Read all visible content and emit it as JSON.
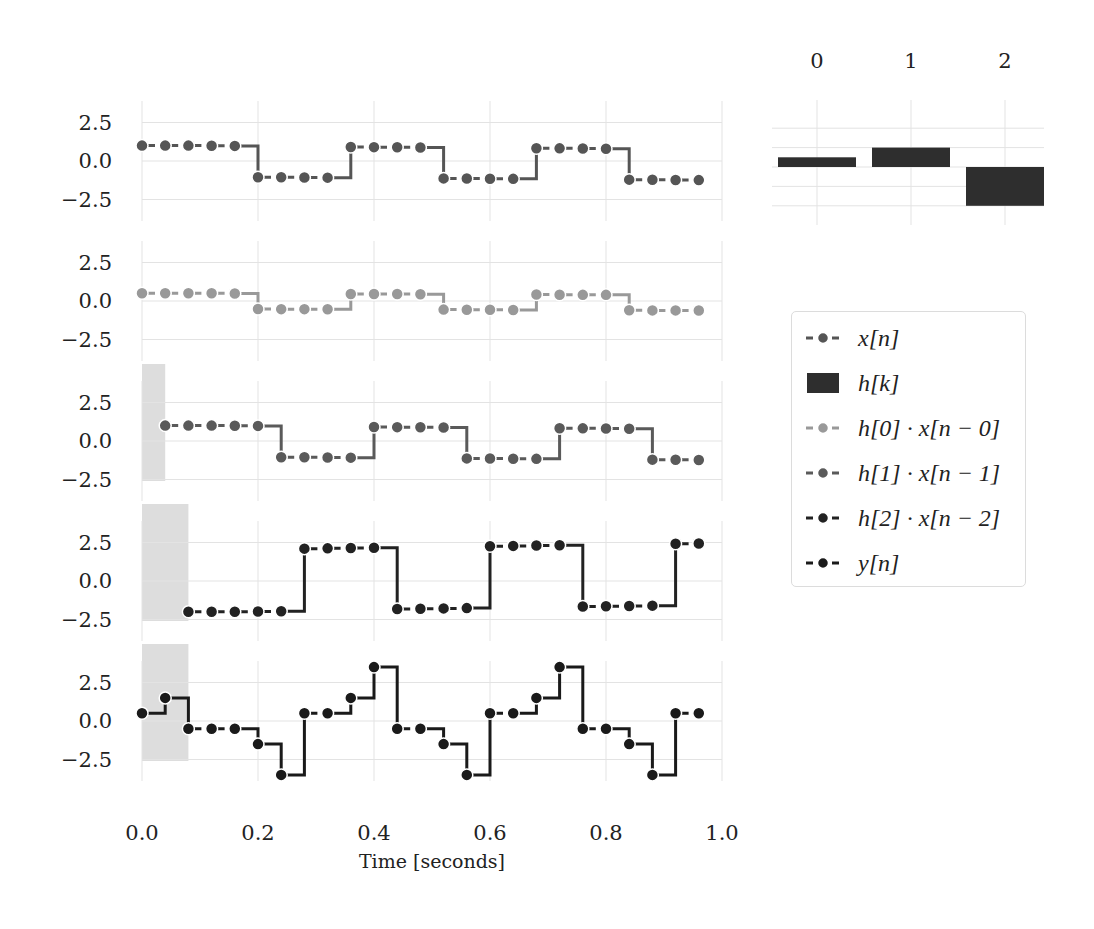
{
  "chart_data": [
    {
      "type": "line",
      "id": "x_n",
      "title": "",
      "legend_label": "x[n]",
      "color": "#555555",
      "xlabel": "Time [seconds]",
      "ylabel": "",
      "xlim": [
        0.0,
        1.0
      ],
      "ylim": [
        -4.0,
        4.0
      ],
      "yticks": [
        2.5,
        0.0,
        -2.5
      ],
      "ytick_labels": [
        "2.5",
        "0.0",
        "−2.5"
      ],
      "xticks": [
        0.0,
        0.2,
        0.4,
        0.6,
        0.8,
        1.0
      ],
      "xtick_labels": [
        "0.0",
        "0.2",
        "0.4",
        "0.6",
        "0.8",
        "1.0"
      ],
      "grid": true,
      "shaded_region": null,
      "x": [
        0.0,
        0.04,
        0.08,
        0.12,
        0.16,
        0.2,
        0.24,
        0.28,
        0.32,
        0.36,
        0.4,
        0.44,
        0.48,
        0.52,
        0.56,
        0.6,
        0.64,
        0.68,
        0.72,
        0.76,
        0.8,
        0.84,
        0.88,
        0.92,
        0.96
      ],
      "values": [
        1.0,
        1.0,
        1.0,
        0.99,
        0.98,
        -1.05,
        -1.06,
        -1.07,
        -1.08,
        0.91,
        0.9,
        0.89,
        0.88,
        -1.13,
        -1.14,
        -1.15,
        -1.16,
        0.83,
        0.82,
        0.81,
        0.8,
        -1.21,
        -1.22,
        -1.23,
        -1.24
      ]
    },
    {
      "type": "line",
      "id": "h0_x",
      "legend_label": "h[0] · x[n − 0]",
      "color": "#999999",
      "ylim": [
        -4.0,
        4.0
      ],
      "shaded_region": null,
      "x": [
        0.0,
        0.04,
        0.08,
        0.12,
        0.16,
        0.2,
        0.24,
        0.28,
        0.32,
        0.36,
        0.4,
        0.44,
        0.48,
        0.52,
        0.56,
        0.6,
        0.64,
        0.68,
        0.72,
        0.76,
        0.8,
        0.84,
        0.88,
        0.92,
        0.96
      ],
      "values": [
        0.5,
        0.5,
        0.5,
        0.5,
        0.49,
        -0.52,
        -0.53,
        -0.53,
        -0.54,
        0.46,
        0.45,
        0.45,
        0.44,
        -0.56,
        -0.57,
        -0.57,
        -0.58,
        0.42,
        0.41,
        0.4,
        0.4,
        -0.6,
        -0.61,
        -0.61,
        -0.62
      ]
    },
    {
      "type": "line",
      "id": "h1_x",
      "legend_label": "h[1] · x[n − 1]",
      "color": "#5a5a5a",
      "ylim": [
        -4.0,
        4.0
      ],
      "shaded_region": [
        0.0,
        0.04
      ],
      "x": [
        0.04,
        0.08,
        0.12,
        0.16,
        0.2,
        0.24,
        0.28,
        0.32,
        0.36,
        0.4,
        0.44,
        0.48,
        0.52,
        0.56,
        0.6,
        0.64,
        0.68,
        0.72,
        0.76,
        0.8,
        0.84,
        0.88,
        0.92,
        0.96
      ],
      "values": [
        1.0,
        1.0,
        1.0,
        0.99,
        0.98,
        -1.05,
        -1.06,
        -1.07,
        -1.08,
        0.91,
        0.9,
        0.89,
        0.88,
        -1.13,
        -1.14,
        -1.15,
        -1.16,
        0.83,
        0.82,
        0.81,
        0.8,
        -1.21,
        -1.22,
        -1.23
      ]
    },
    {
      "type": "line",
      "id": "h2_x",
      "legend_label": "h[2] · x[n − 2]",
      "color": "#222222",
      "ylim": [
        -4.0,
        4.0
      ],
      "shaded_region": [
        0.0,
        0.08
      ],
      "x": [
        0.08,
        0.12,
        0.16,
        0.2,
        0.24,
        0.28,
        0.32,
        0.36,
        0.4,
        0.44,
        0.48,
        0.52,
        0.56,
        0.6,
        0.64,
        0.68,
        0.72,
        0.76,
        0.8,
        0.84,
        0.88,
        0.92,
        0.96
      ],
      "values": [
        -2.0,
        -2.0,
        -2.0,
        -1.98,
        -1.96,
        2.1,
        2.12,
        2.14,
        2.16,
        -1.82,
        -1.8,
        -1.78,
        -1.76,
        2.26,
        2.28,
        2.3,
        2.32,
        -1.66,
        -1.64,
        -1.62,
        -1.6,
        2.42,
        2.44
      ]
    },
    {
      "type": "line",
      "id": "y_n",
      "legend_label": "y[n]",
      "color": "#1a1a1a",
      "ylim": [
        -4.0,
        4.0
      ],
      "shaded_region": [
        0.0,
        0.08
      ],
      "x": [
        0.0,
        0.04,
        0.08,
        0.12,
        0.16,
        0.2,
        0.24,
        0.28,
        0.32,
        0.36,
        0.4,
        0.44,
        0.48,
        0.52,
        0.56,
        0.6,
        0.64,
        0.68,
        0.72,
        0.76,
        0.8,
        0.84,
        0.88,
        0.92,
        0.96
      ],
      "values": [
        0.5,
        1.5,
        -0.5,
        -0.5,
        -0.5,
        -1.5,
        -3.5,
        0.5,
        0.5,
        1.5,
        3.5,
        -0.5,
        -0.5,
        -1.5,
        -3.5,
        0.5,
        0.5,
        1.5,
        3.5,
        -0.5,
        -0.5,
        -1.5,
        -3.5,
        0.5,
        0.5
      ]
    },
    {
      "type": "bar",
      "id": "h_k",
      "legend_label": "h[k]",
      "color": "#2e2e2e",
      "categories": [
        "0",
        "1",
        "2"
      ],
      "values": [
        0.5,
        1.0,
        -2.0
      ],
      "ylim": [
        -2.5,
        2.5
      ],
      "yticks": [
        2,
        1,
        0,
        -1,
        -2
      ],
      "grid": true,
      "tick_position": "top"
    }
  ],
  "legend": {
    "position": "right",
    "items": [
      {
        "label": "x[n]",
        "kind": "line-marker",
        "color": "#555555"
      },
      {
        "label": "h[k]",
        "kind": "bar",
        "color": "#2e2e2e"
      },
      {
        "label": "h[0] · x[n − 0]",
        "kind": "line-marker",
        "color": "#999999"
      },
      {
        "label": "h[1] · x[n − 1]",
        "kind": "line-marker",
        "color": "#5a5a5a"
      },
      {
        "label": "h[2] · x[n − 2]",
        "kind": "line-marker",
        "color": "#222222"
      },
      {
        "label": "y[n]",
        "kind": "line-marker",
        "color": "#1a1a1a"
      }
    ]
  },
  "axes": {
    "xlabel": "Time [seconds]",
    "xtick_labels": [
      "0.0",
      "0.2",
      "0.4",
      "0.6",
      "0.8",
      "1.0"
    ],
    "ytick_labels": [
      "2.5",
      "0.0",
      "−2.5"
    ],
    "bar_tick_labels": [
      "0",
      "1",
      "2"
    ]
  },
  "colors": {
    "grid": "#e3e3e3",
    "shade": "#dddddd",
    "text": "#222222"
  }
}
